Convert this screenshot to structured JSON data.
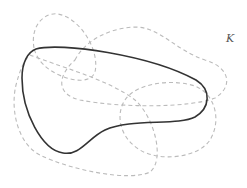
{
  "figure": {
    "label": "K",
    "colors": {
      "solid_curve": "#333333",
      "dashed_curves": "#bbbbbb",
      "background": "#ffffff",
      "label": "#555555"
    },
    "solid_curve": {
      "description": "closed solid curve (set K boundary)",
      "path": "M 36 49 C 60 42, 150 55, 196 80 C 212 90, 210 108, 195 117 C 178 126, 130 118, 105 130 C 88 138, 80 156, 63 153 C 42 150, 22 112, 22 78 C 22 62, 28 52, 36 49 Z"
    },
    "dashed_curves": [
      {
        "name": "upper-left-loop",
        "path": "M 34 48 C 30 25, 45 12, 58 14 C 80 18, 100 50, 95 72 C 90 86, 65 80, 50 70 C 40 63, 36 56, 34 48 Z"
      },
      {
        "name": "wide-upper-loop",
        "path": "M 75 60 C 85 40, 110 28, 135 27 C 160 27, 175 50, 205 60 C 232 68, 232 88, 215 98 C 190 108, 120 108, 80 100 C 55 94, 58 75, 75 60 Z"
      },
      {
        "name": "lower-right-loop",
        "path": "M 125 100 C 135 84, 170 78, 195 86 C 215 94, 222 120, 210 140 C 198 158, 160 162, 140 150 C 120 138, 115 115, 125 100 Z"
      },
      {
        "name": "big-lower-left-loop",
        "path": "M 30 55 C 55 65, 110 80, 135 100 C 155 118, 165 160, 150 172 C 130 182, 70 170, 40 155 C 18 144, 10 110, 16 85 C 20 70, 24 60, 30 55 Z"
      }
    ]
  }
}
